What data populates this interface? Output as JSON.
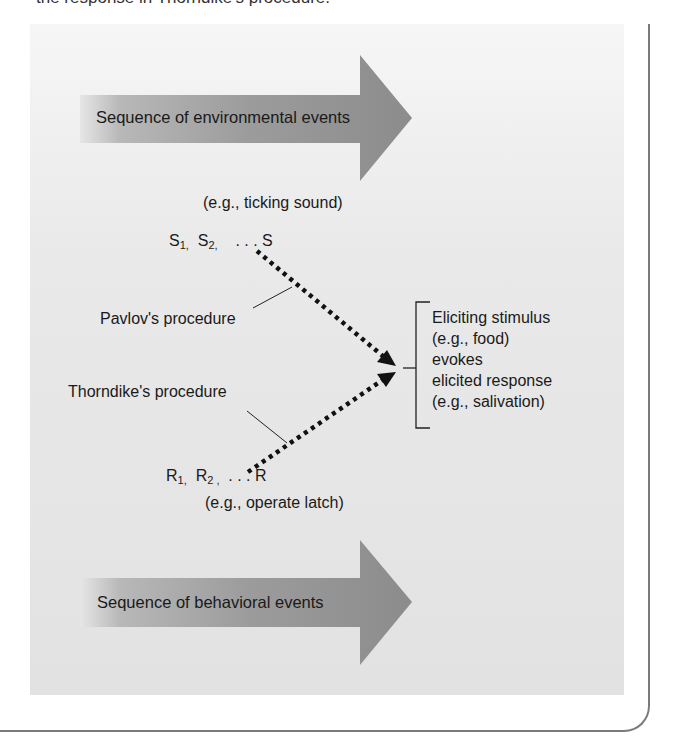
{
  "caption": "the response in Thorndike's procedure.",
  "environmental_arrow": {
    "label": "Sequence of environmental events"
  },
  "environmental_example": "(e.g., ticking sound)",
  "stimulus_sequence": {
    "s1": "S",
    "s1_sub": "1,",
    "s2": "S",
    "s2_sub": "2,",
    "ellipsis": ". . .",
    "final": "S"
  },
  "pavlov_label": "Pavlov's procedure",
  "thorndike_label": "Thorndike's procedure",
  "response_sequence": {
    "r1": "R",
    "r1_sub": "1,",
    "r2": "R",
    "r2_sub": "2 ,",
    "ellipsis": ". . .",
    "final": "R"
  },
  "behavioral_example": "(e.g., operate latch)",
  "behavioral_arrow": {
    "label": "Sequence of behavioral events"
  },
  "outcome": {
    "lines": [
      "Eliciting stimulus",
      "(e.g., food)",
      "evokes",
      "elicited response",
      "(e.g., salivation)"
    ]
  },
  "colors": {
    "arrow_fill": "#8f8f8f",
    "panel": "#e4e4e4",
    "frame": "#7a7a7a",
    "text": "#1a1a1a"
  }
}
